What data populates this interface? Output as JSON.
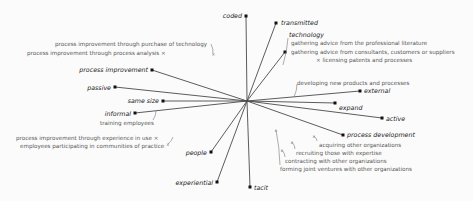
{
  "diagram": {
    "type": "biplot",
    "center": [
      247,
      101
    ],
    "line_color": "#4a4a4a",
    "point_color": "#111111",
    "axes": [
      {
        "label": "coded",
        "end": [
          246,
          16
        ],
        "label_pos": [
          229,
          13
        ],
        "anchor": "right"
      },
      {
        "label": "transmitted",
        "end": [
          276,
          23
        ],
        "label_pos": [
          281,
          20
        ],
        "anchor": "left"
      },
      {
        "label": "technology",
        "end": [
          285,
          52
        ],
        "label_pos": [
          289,
          32
        ],
        "anchor": "left"
      },
      {
        "label": "external",
        "end": [
          360,
          91
        ],
        "label_pos": [
          364,
          88
        ],
        "anchor": "left"
      },
      {
        "label": "expand",
        "end": [
          335,
          103
        ],
        "label_pos": [
          339,
          105
        ],
        "anchor": "left"
      },
      {
        "label": "active",
        "end": [
          382,
          118
        ],
        "label_pos": [
          386,
          116
        ],
        "anchor": "left"
      },
      {
        "label": "process development",
        "end": [
          343,
          135
        ],
        "label_pos": [
          347,
          132
        ],
        "anchor": "left"
      },
      {
        "label": "tacit",
        "end": [
          250,
          187
        ],
        "label_pos": [
          254,
          185
        ],
        "anchor": "left"
      },
      {
        "label": "experiential",
        "end": [
          217,
          182
        ],
        "label_pos": [
          178,
          180
        ],
        "anchor": "right"
      },
      {
        "label": "people",
        "end": [
          211,
          152
        ],
        "label_pos": [
          188,
          150
        ],
        "anchor": "right"
      },
      {
        "label": "informal",
        "end": [
          135,
          113
        ],
        "label_pos": [
          110,
          111
        ],
        "anchor": "right"
      },
      {
        "label": "same size",
        "end": [
          163,
          101
        ],
        "label_pos": [
          133,
          98
        ],
        "anchor": "right"
      },
      {
        "label": "passive",
        "end": [
          115,
          87
        ],
        "label_pos": [
          88,
          85
        ],
        "anchor": "right"
      },
      {
        "label": "process improvement",
        "end": [
          152,
          70
        ],
        "label_pos": [
          87,
          67
        ],
        "anchor": "right"
      }
    ],
    "items": [
      {
        "label": "process improvement through purchase of technology",
        "pos": [
          55,
          42
        ]
      },
      {
        "label": "process improvement through process analysis ×",
        "pos": [
          27,
          51
        ]
      },
      {
        "label": "gathering advice from the professional literature",
        "pos": [
          291,
          41
        ]
      },
      {
        "label": "gathering advice from consultants, customers or suppliers",
        "pos": [
          291,
          50
        ]
      },
      {
        "label": "× licensing patents and processes",
        "pos": [
          316,
          58
        ]
      },
      {
        "label": "developing new products and processes",
        "pos": [
          297,
          81
        ]
      },
      {
        "label": "training employees",
        "pos": [
          100,
          121
        ]
      },
      {
        "label": "process improvement through experience in use ×",
        "pos": [
          16,
          136
        ]
      },
      {
        "label": "employees participating in communities of practice",
        "pos": [
          20,
          144
        ]
      },
      {
        "label": "acquiring other organizations",
        "pos": [
          319,
          143
        ]
      },
      {
        "label": "recruiting those with expertise",
        "pos": [
          296,
          151
        ]
      },
      {
        "label": "contracting with other organizations",
        "pos": [
          285,
          159
        ]
      },
      {
        "label": "forming joint ventures with other organizations",
        "pos": [
          280,
          167
        ]
      }
    ],
    "pointers": [
      {
        "from": [
          211,
          44
        ],
        "to": [
          213,
          54
        ],
        "mark": "×"
      },
      {
        "from": [
          288,
          38
        ],
        "to": [
          283,
          65
        ]
      },
      {
        "from": [
          297,
          84
        ],
        "to": [
          294,
          97
        ]
      },
      {
        "from": [
          156,
          111
        ],
        "to": [
          153,
          120
        ]
      },
      {
        "from": [
          173,
          137
        ],
        "to": [
          168,
          144
        ],
        "mark": "x"
      },
      {
        "from": [
          317,
          141
        ],
        "to": [
          314,
          136
        ],
        "mark": "x"
      },
      {
        "from": [
          295,
          149
        ],
        "to": [
          292,
          142
        ],
        "mark": "x"
      },
      {
        "from": [
          285,
          157
        ],
        "to": [
          282,
          150
        ],
        "mark": "x"
      },
      {
        "from": [
          280,
          165
        ],
        "to": [
          276,
          130
        ],
        "mark": "x"
      }
    ]
  }
}
